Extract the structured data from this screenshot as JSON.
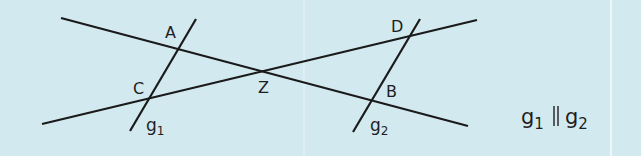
{
  "colors": {
    "background": "#d3e9f0",
    "line": "#1a1a1a",
    "separator": "#e6f2f6"
  },
  "points": {
    "A": "A",
    "B": "B",
    "C": "C",
    "D": "D",
    "Z": "Z"
  },
  "lines": {
    "g1": {
      "name": "g",
      "sub": "1"
    },
    "g2": {
      "name": "g",
      "sub": "2"
    }
  },
  "caption": {
    "left": "g",
    "left_sub": "1",
    "relation": "∥",
    "right": "g",
    "right_sub": "2"
  }
}
